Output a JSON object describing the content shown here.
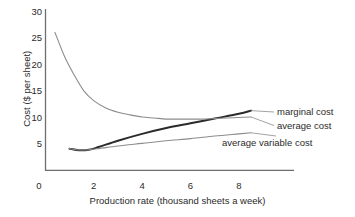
{
  "chart_data": {
    "type": "line",
    "title": "",
    "xlabel": "Production rate (thousand sheets a week)",
    "ylabel": "Cost ($ per sheet)",
    "xlim": [
      0,
      9.6
    ],
    "ylim": [
      0,
      30
    ],
    "xticks": [
      0,
      2,
      4,
      6,
      8
    ],
    "xtick_labels": [
      "0",
      "2",
      "4",
      "6",
      "8"
    ],
    "yticks": [
      0,
      5,
      10,
      15,
      20,
      25,
      30
    ],
    "ytick_labels": [
      "0",
      "5",
      "10",
      "15",
      "20",
      "25",
      "30"
    ],
    "grid": false,
    "legend_position": "right-inline",
    "series": [
      {
        "name": "marginal cost",
        "label": "marginal cost",
        "color": "#2b2b2b",
        "width": 2.0,
        "points": [
          {
            "x": 1.0,
            "y": 4.1
          },
          {
            "x": 1.4,
            "y": 3.8
          },
          {
            "x": 1.8,
            "y": 3.9
          },
          {
            "x": 2.2,
            "y": 4.4
          },
          {
            "x": 3.0,
            "y": 5.6
          },
          {
            "x": 4.0,
            "y": 6.9
          },
          {
            "x": 5.0,
            "y": 8.0
          },
          {
            "x": 6.0,
            "y": 8.9
          },
          {
            "x": 7.0,
            "y": 9.8
          },
          {
            "x": 8.0,
            "y": 10.7
          },
          {
            "x": 8.5,
            "y": 11.3
          }
        ]
      },
      {
        "name": "average cost",
        "label": "average cost",
        "color": "#8c8c8c",
        "width": 1.1,
        "points": [
          {
            "x": 0.4,
            "y": 26.1
          },
          {
            "x": 0.8,
            "y": 21.5
          },
          {
            "x": 1.2,
            "y": 18.0
          },
          {
            "x": 1.6,
            "y": 15.0
          },
          {
            "x": 2.0,
            "y": 13.2
          },
          {
            "x": 2.5,
            "y": 11.8
          },
          {
            "x": 3.0,
            "y": 11.0
          },
          {
            "x": 3.5,
            "y": 10.5
          },
          {
            "x": 4.0,
            "y": 10.1
          },
          {
            "x": 4.5,
            "y": 9.9
          },
          {
            "x": 5.0,
            "y": 9.7
          },
          {
            "x": 5.5,
            "y": 9.7
          },
          {
            "x": 6.0,
            "y": 9.7
          },
          {
            "x": 6.5,
            "y": 9.7
          },
          {
            "x": 7.0,
            "y": 9.8
          },
          {
            "x": 7.5,
            "y": 9.9
          },
          {
            "x": 8.0,
            "y": 10.0
          },
          {
            "x": 8.5,
            "y": 10.1
          }
        ]
      },
      {
        "name": "average variable cost",
        "label": "average variable cost",
        "color": "#8c8c8c",
        "width": 1.1,
        "points": [
          {
            "x": 1.0,
            "y": 4.1
          },
          {
            "x": 1.4,
            "y": 3.85
          },
          {
            "x": 1.8,
            "y": 3.9
          },
          {
            "x": 2.2,
            "y": 4.1
          },
          {
            "x": 3.0,
            "y": 4.6
          },
          {
            "x": 4.0,
            "y": 5.1
          },
          {
            "x": 5.0,
            "y": 5.6
          },
          {
            "x": 6.0,
            "y": 6.0
          },
          {
            "x": 7.0,
            "y": 6.5
          },
          {
            "x": 8.0,
            "y": 6.9
          },
          {
            "x": 8.5,
            "y": 7.1
          }
        ]
      }
    ],
    "annotations": [
      {
        "text": "marginal cost",
        "x": 8.65,
        "y": 11.4
      },
      {
        "text": "average cost",
        "x": 8.65,
        "y": 9.8
      },
      {
        "text": "average variable cost",
        "x": 8.65,
        "y": 7.1
      }
    ],
    "axis_color": "#6e6e6e"
  }
}
